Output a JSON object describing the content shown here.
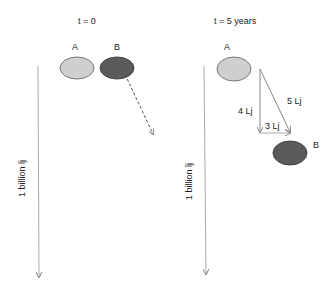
{
  "panels": [
    {
      "title": "t = 0",
      "label_a": "A",
      "label_b": "B",
      "distance_label": "1 billion lj"
    },
    {
      "title": "t = 5 years",
      "label_a": "A",
      "label_b": "B",
      "distance_label": "1 billion lj",
      "triangle": {
        "vertical": "4 Lj",
        "horizontal": "3 Lj",
        "hypotenuse": "5 Lj"
      }
    }
  ],
  "colors": {
    "object_a": "#cfcfcf",
    "object_b": "#5a5a5a",
    "line": "#999999"
  }
}
